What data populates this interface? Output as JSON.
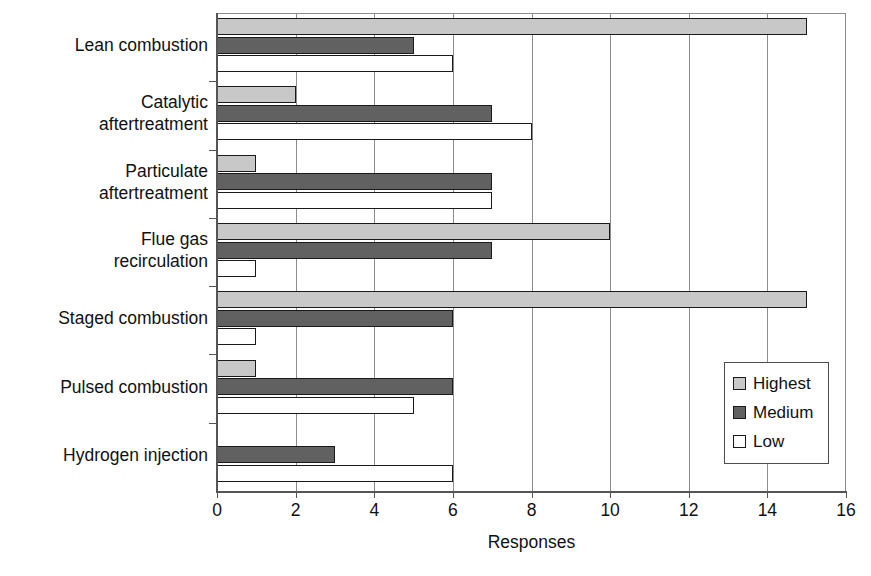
{
  "chart_data": {
    "type": "bar",
    "orientation": "horizontal",
    "title": "",
    "xlabel": "Responses",
    "ylabel": "",
    "xlim": [
      0,
      16
    ],
    "xticks": [
      0,
      2,
      4,
      6,
      8,
      10,
      12,
      14,
      16
    ],
    "xtick_labels": [
      "0",
      "2",
      "4",
      "6",
      "8",
      "10",
      "12",
      "14",
      "16"
    ],
    "grid": "vertical",
    "legend_position": "right-lower",
    "categories": [
      "Lean combustion",
      "Catalytic aftertreatment",
      "Particulate aftertreatment",
      "Flue gas recirculation",
      "Staged combustion",
      "Pulsed combustion",
      "Hydrogen injection"
    ],
    "category_label_lines": [
      [
        "Lean combustion"
      ],
      [
        "Catalytic",
        "aftertreatment"
      ],
      [
        "Particulate",
        "aftertreatment"
      ],
      [
        "Flue gas",
        "recirculation"
      ],
      [
        "Staged combustion"
      ],
      [
        "Pulsed combustion"
      ],
      [
        "Hydrogen injection"
      ]
    ],
    "series": [
      {
        "name": "Highest",
        "color": "#c8c8c8",
        "values": [
          15,
          2,
          1,
          10,
          15,
          1,
          0
        ]
      },
      {
        "name": "Medium",
        "color": "#616161",
        "values": [
          5,
          7,
          7,
          7,
          6,
          6,
          3
        ]
      },
      {
        "name": "Low",
        "color": "#ffffff",
        "values": [
          6,
          8,
          7,
          1,
          1,
          5,
          6
        ]
      }
    ]
  },
  "legend": {
    "items": [
      {
        "label": "Highest",
        "swatch": "highest"
      },
      {
        "label": "Medium",
        "swatch": "medium"
      },
      {
        "label": "Low",
        "swatch": "low"
      }
    ]
  },
  "axis": {
    "x_title": "Responses"
  },
  "colors": {
    "highest": "#c8c8c8",
    "medium": "#616161",
    "low": "#ffffff",
    "bar_outline": "#1a1a1a",
    "gridline": "#8c8c8c",
    "axis": "#555555",
    "text": "#111111",
    "background": "#ffffff"
  }
}
